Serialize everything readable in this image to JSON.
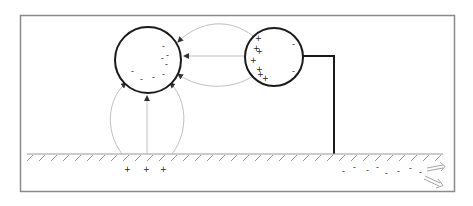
{
  "figure": {
    "colors": {
      "frame": "#8a8a8a",
      "stroke": "#1a1a1a",
      "field_line": "#b8b8b8",
      "ground": "#999999"
    }
  },
  "left_sphere": {
    "label": "induced-sphere",
    "charges": [
      "-",
      "-",
      "-",
      "-",
      "-",
      "-",
      "-",
      "-",
      "-"
    ]
  },
  "right_sphere": {
    "label": "source-sphere",
    "positive_charges": [
      "+",
      "+",
      "+",
      "+",
      "+",
      "+",
      "+",
      "+"
    ],
    "negative_charges": [
      "-",
      "-"
    ]
  },
  "ground": {
    "positive_charges": [
      "+",
      "+",
      "+"
    ],
    "negative_charges": [
      "-",
      "-",
      "-",
      "-",
      "-",
      "-",
      "-",
      "-",
      "-"
    ],
    "flow_arrows": 2
  }
}
